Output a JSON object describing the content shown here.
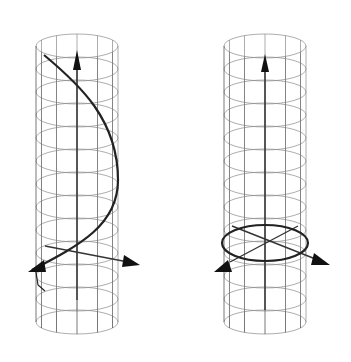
{
  "figure": {
    "panels": [
      {
        "id": "left",
        "label": "helix-on-cylinder",
        "cylinder": {
          "cx": 77,
          "rx": 41,
          "ry": 12,
          "top": 46,
          "bottom": 322,
          "rings": 13,
          "meridians": 12
        },
        "curve": {
          "type": "helix",
          "color": "#222222"
        },
        "axes": [
          "vertical-up",
          "diagonal-right",
          "diagonal-left"
        ]
      },
      {
        "id": "right",
        "label": "circle-on-cylinder",
        "cylinder": {
          "cx": 265,
          "rx": 41,
          "ry": 12,
          "top": 46,
          "bottom": 322,
          "rings": 13,
          "meridians": 12
        },
        "curve": {
          "type": "circle",
          "y": 243,
          "color": "#222222"
        },
        "axes": [
          "vertical-up",
          "diagonal-right",
          "diagonal-left"
        ]
      }
    ],
    "colors": {
      "background": "#ffffff",
      "grid": "#8a8a8a",
      "curve": "#222222",
      "arrow": "#111111"
    }
  }
}
